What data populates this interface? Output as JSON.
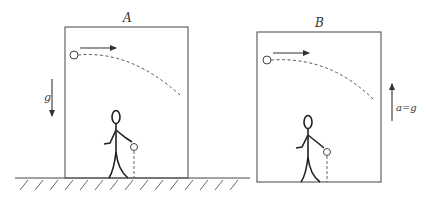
{
  "diagram": {
    "elevator_a": {
      "label": "A",
      "gravity_label": "g",
      "gravity_direction": "down"
    },
    "elevator_b": {
      "label": "B",
      "acceleration_label": "a=g",
      "acceleration_direction": "up"
    },
    "colors": {
      "stroke": "#333333",
      "box": "#555555",
      "background": "#ffffff"
    }
  }
}
